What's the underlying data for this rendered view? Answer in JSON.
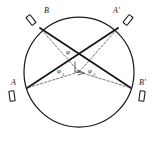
{
  "figure": {
    "type": "geometric-optics-diagram",
    "background_color": "#ffffff",
    "line_color": "#141414",
    "dash_color": "#4a4a4a"
  },
  "circle": {
    "center_x": 79,
    "center_y": 72,
    "radius": 55,
    "stroke": "#1b1b1b"
  },
  "points": [
    {
      "id": "B",
      "label": "B",
      "label_x": 44,
      "label_y": 13,
      "cx": 40,
      "cy": 28
    },
    {
      "id": "Ap",
      "label": "A'",
      "label_x": 113,
      "label_y": 13,
      "cx": 118,
      "cy": 28
    },
    {
      "id": "A",
      "label": "A",
      "label_x": 11,
      "label_y": 85,
      "cx": 27,
      "cy": 88
    },
    {
      "id": "Bp",
      "label": "B'",
      "label_x": 139,
      "label_y": 85,
      "cx": 131,
      "cy": 88
    }
  ],
  "chords": [
    {
      "id": "chord-B-Bp",
      "from": "B",
      "to": "Bp",
      "x1": 40,
      "y1": 28,
      "x2": 131,
      "y2": 88
    },
    {
      "id": "chord-A-Ap",
      "from": "A",
      "to": "Ap",
      "x1": 27,
      "y1": 88,
      "x2": 118,
      "y2": 28
    }
  ],
  "vertex": {
    "x": 79,
    "y": 72
  },
  "dashed_rays": [
    {
      "id": "ray-to-B",
      "x1": 79,
      "y1": 72,
      "x2": 40,
      "y2": 28
    },
    {
      "id": "ray-to-Ap",
      "x1": 79,
      "y1": 72,
      "x2": 118,
      "y2": 28
    },
    {
      "id": "ray-to-A",
      "x1": 79,
      "y1": 72,
      "x2": 27,
      "y2": 88
    },
    {
      "id": "ray-to-Bp",
      "x1": 79,
      "y1": 72,
      "x2": 131,
      "y2": 88
    }
  ],
  "angles": [
    {
      "id": "phi",
      "symbol": "φ",
      "subscript": "",
      "x": 66,
      "y": 54
    },
    {
      "id": "phi-1",
      "symbol": "φ",
      "subscript": "1",
      "x": 60,
      "y": 73
    },
    {
      "id": "phi-2",
      "symbol": "φ",
      "subscript": "2",
      "x": 91,
      "y": 73
    }
  ],
  "detectors": [
    {
      "id": "detector-B",
      "cx": 31,
      "cy": 20,
      "w": 5,
      "h": 10,
      "rotate": -38
    },
    {
      "id": "detector-Ap",
      "cx": 128,
      "cy": 20,
      "w": 5,
      "h": 10,
      "rotate": 38
    },
    {
      "id": "detector-A",
      "cx": 12,
      "cy": 96,
      "w": 5,
      "h": 10,
      "rotate": -8
    },
    {
      "id": "detector-Bp",
      "cx": 142,
      "cy": 96,
      "w": 5,
      "h": 10,
      "rotate": 8
    }
  ],
  "marks": {
    "vertical_tick": {
      "x1": 75,
      "y1": 62,
      "x2": 75,
      "y2": 72
    },
    "corner_tick": {
      "x1": 75,
      "y1": 72,
      "x2": 79,
      "y2": 72
    },
    "arrow_left": {
      "x1": 78,
      "y1": 70,
      "x2": 84,
      "y2": 73
    },
    "arrow_right": {
      "x1": 78,
      "y1": 75,
      "x2": 84,
      "y2": 73
    }
  }
}
